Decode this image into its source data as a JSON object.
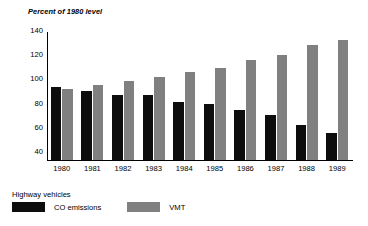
{
  "chart_data": {
    "type": "bar",
    "title": "Percent of 1980 level",
    "xlabel": "",
    "ylabel": "Percent of 1980 level",
    "categories": [
      "1980",
      "1981",
      "1982",
      "1983",
      "1984",
      "1985",
      "1986",
      "1987",
      "1988",
      "1989"
    ],
    "series": [
      {
        "name": "CO emissions",
        "color": "#0d0d0d",
        "values": [
          100,
          97,
          94,
          94,
          88,
          86,
          81,
          77,
          69,
          62
        ]
      },
      {
        "name": "VMT",
        "color": "#808080",
        "values": [
          99,
          102,
          105,
          109,
          113,
          116,
          123,
          127,
          135,
          139
        ]
      }
    ],
    "ylim": [
      40,
      145
    ],
    "yticks": [
      40,
      60,
      80,
      100,
      120,
      140
    ],
    "ytick_labels": [
      "40",
      "60",
      "80",
      "100",
      "120",
      "140"
    ],
    "grid": false,
    "legend_position": "bottom-left"
  },
  "legend": {
    "title": "Highway vehicles",
    "entries": [
      {
        "label": "CO emissions",
        "swatch": "co"
      },
      {
        "label": "VMT",
        "swatch": "vmt"
      }
    ]
  }
}
